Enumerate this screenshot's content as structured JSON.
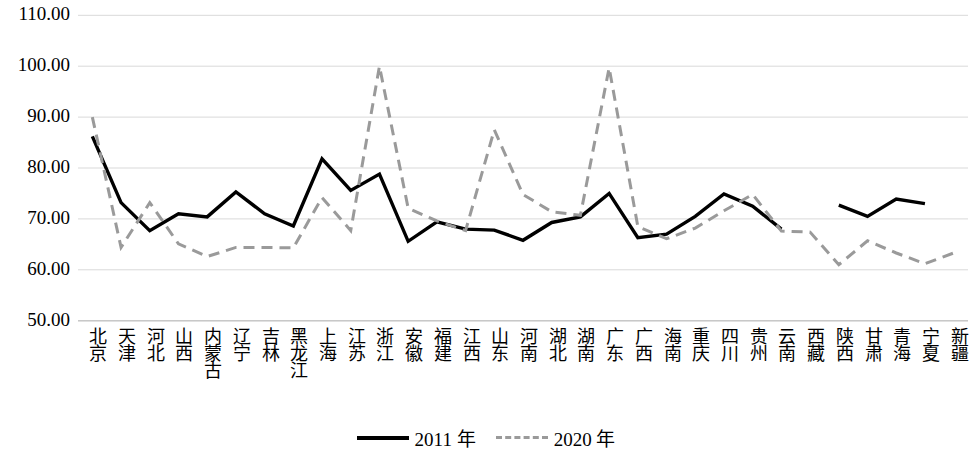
{
  "chart_data": {
    "type": "line",
    "title": "",
    "xlabel": "",
    "ylabel": "",
    "ylim": [
      50.0,
      110.0
    ],
    "ytick_labels": [
      "110.00",
      "100.00",
      "90.00",
      "80.00",
      "70.00",
      "60.00",
      "50.00"
    ],
    "ytick_values": [
      110,
      100,
      90,
      80,
      70,
      60,
      50
    ],
    "grid": true,
    "legend_position": "bottom-center",
    "categories": [
      "北京",
      "天津",
      "河北",
      "山西",
      "内蒙古",
      "辽宁",
      "吉林",
      "黑龙江",
      "上海",
      "江苏",
      "浙江",
      "安徽",
      "福建",
      "江西",
      "山东",
      "河南",
      "湖北",
      "湖南",
      "广东",
      "广西",
      "海南",
      "重庆",
      "四川",
      "贵州",
      "云南",
      "西藏",
      "陕西",
      "甘肃",
      "青海",
      "宁夏",
      "新疆"
    ],
    "series": [
      {
        "name": "2011 年",
        "style": "solid",
        "color": "#000000",
        "values": [
          86.2,
          73.2,
          67.7,
          71.0,
          70.4,
          75.3,
          71.0,
          68.6,
          81.8,
          75.6,
          78.8,
          65.6,
          69.4,
          68.0,
          67.8,
          65.8,
          69.3,
          70.4,
          75.0,
          66.3,
          67.0,
          70.5,
          74.9,
          72.5,
          68.0,
          null,
          72.7,
          70.5,
          73.9,
          73.0,
          null
        ]
      },
      {
        "name": "2020 年",
        "style": "dashed",
        "color": "#9a9a9a",
        "values": [
          90.0,
          64.4,
          73.2,
          65.1,
          62.6,
          64.4,
          64.4,
          64.3,
          74.2,
          67.7,
          100.0,
          72.1,
          69.6,
          67.7,
          87.5,
          74.8,
          71.4,
          70.7,
          99.7,
          68.5,
          66.1,
          68.2,
          71.6,
          74.8,
          67.6,
          67.4,
          61.0,
          65.7,
          63.3,
          61.2,
          63.3
        ]
      }
    ]
  },
  "legend": {
    "items": [
      {
        "label": "2011 年",
        "style": "solid"
      },
      {
        "label": "2020 年",
        "style": "dashed"
      }
    ]
  },
  "colors": {
    "series_2011": "#000000",
    "series_2020": "#9a9a9a",
    "gridline": "#d9d9d9",
    "background": "#ffffff"
  }
}
